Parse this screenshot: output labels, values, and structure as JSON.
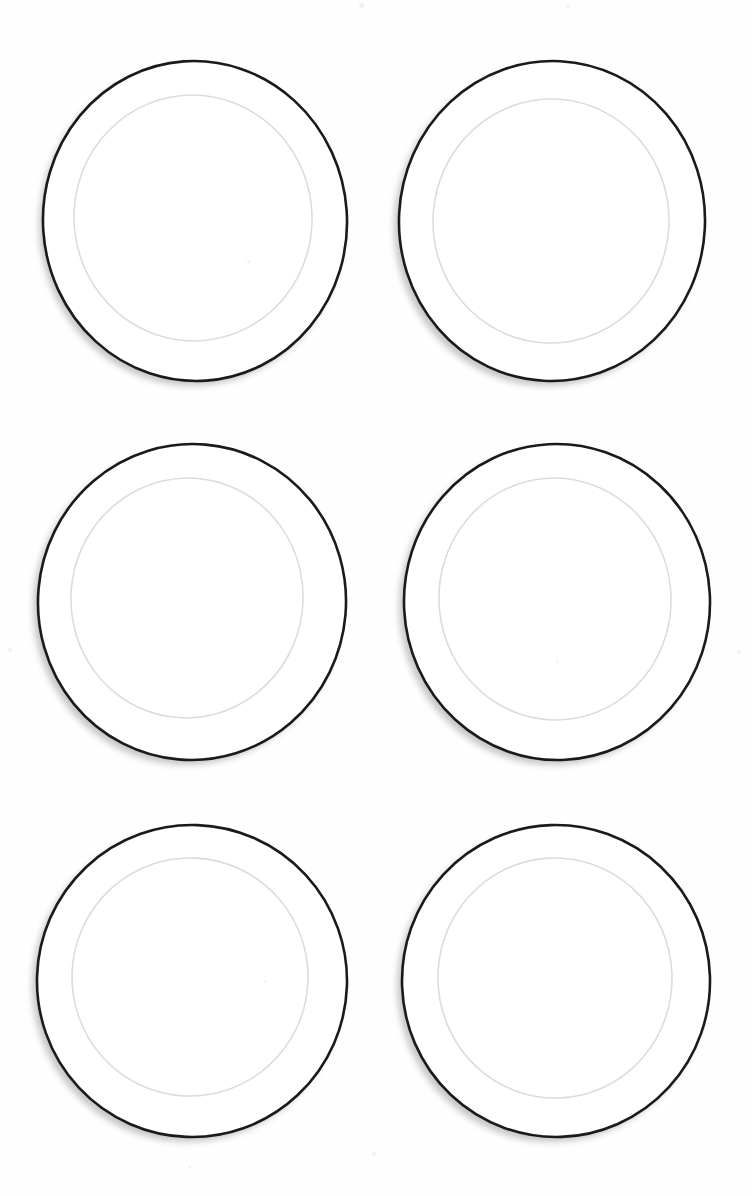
{
  "scene": {
    "title": "Six white dinner plates on white background",
    "background_color": "#fefefe",
    "canvas_width": 752,
    "canvas_height": 1196,
    "object_name": "dinner-plate",
    "object_count": 6,
    "grid_columns": 2,
    "grid_rows": 3
  },
  "style": {
    "rim_color": "#1a1a1a",
    "rim_stroke_width": 2.6,
    "well_ring_color": "#dcdcde",
    "well_ring_stroke_width": 1.6,
    "plate_fill": "#ffffff",
    "shadow_color": "#9a9a9e",
    "shadow_opacity": 0.55
  },
  "plates": [
    {
      "id": "plate-1",
      "position_label": "row-1-left",
      "left": 38,
      "top": 58,
      "width": 316,
      "height": 330,
      "outer_cx": 157,
      "outer_cy": 163,
      "outer_rx": 152,
      "outer_ry": 160,
      "outer_rotate": -4,
      "inner_cx": 155,
      "inner_cy": 160,
      "inner_rx": 119,
      "inner_ry": 123,
      "inner_rotate": -6,
      "shadow_dx": -4,
      "shadow_dy": 5
    },
    {
      "id": "plate-2",
      "position_label": "row-1-right",
      "left": 394,
      "top": 58,
      "width": 316,
      "height": 330,
      "outer_cx": 158,
      "outer_cy": 163,
      "outer_rx": 153,
      "outer_ry": 160,
      "outer_rotate": 3,
      "inner_cx": 157,
      "inner_cy": 163,
      "inner_rx": 118,
      "inner_ry": 122,
      "inner_rotate": 4,
      "shadow_dx": -5,
      "shadow_dy": 5
    },
    {
      "id": "plate-3",
      "position_label": "row-2-left",
      "left": 32,
      "top": 440,
      "width": 320,
      "height": 328,
      "outer_cx": 160,
      "outer_cy": 162,
      "outer_rx": 154,
      "outer_ry": 158,
      "outer_rotate": 5,
      "inner_cx": 155,
      "inner_cy": 158,
      "inner_rx": 116,
      "inner_ry": 120,
      "inner_rotate": 8,
      "shadow_dx": -5,
      "shadow_dy": 5
    },
    {
      "id": "plate-4",
      "position_label": "row-2-right",
      "left": 398,
      "top": 440,
      "width": 318,
      "height": 328,
      "outer_cx": 159,
      "outer_cy": 162,
      "outer_rx": 153,
      "outer_ry": 158,
      "outer_rotate": -3,
      "inner_cx": 157,
      "inner_cy": 159,
      "inner_rx": 116,
      "inner_ry": 121,
      "inner_rotate": -5,
      "shadow_dx": -5,
      "shadow_dy": 5
    },
    {
      "id": "plate-5",
      "position_label": "row-3-left",
      "left": 32,
      "top": 822,
      "width": 320,
      "height": 322,
      "outer_cx": 160,
      "outer_cy": 159,
      "outer_rx": 155,
      "outer_ry": 156,
      "outer_rotate": 2,
      "inner_cx": 158,
      "inner_cy": 155,
      "inner_rx": 118,
      "inner_ry": 119,
      "inner_rotate": 3,
      "shadow_dx": -5,
      "shadow_dy": 5
    },
    {
      "id": "plate-6",
      "position_label": "row-3-right",
      "left": 396,
      "top": 822,
      "width": 320,
      "height": 322,
      "outer_cx": 160,
      "outer_cy": 159,
      "outer_rx": 154,
      "outer_ry": 156,
      "outer_rotate": -2,
      "inner_cx": 159,
      "inner_cy": 156,
      "inner_rx": 117,
      "inner_ry": 120,
      "inner_rotate": -3,
      "shadow_dx": -5,
      "shadow_dy": 5
    }
  ],
  "specks": [
    {
      "left": 359,
      "top": 3,
      "size": 5
    },
    {
      "left": 566,
      "top": 4,
      "size": 4
    },
    {
      "left": 737,
      "top": 650,
      "size": 4
    },
    {
      "left": 8,
      "top": 648,
      "size": 4
    },
    {
      "left": 247,
      "top": 260,
      "size": 3
    },
    {
      "left": 556,
      "top": 660,
      "size": 3
    },
    {
      "left": 264,
      "top": 980,
      "size": 3
    },
    {
      "left": 372,
      "top": 1152,
      "size": 4
    },
    {
      "left": 188,
      "top": 1166,
      "size": 3
    }
  ]
}
